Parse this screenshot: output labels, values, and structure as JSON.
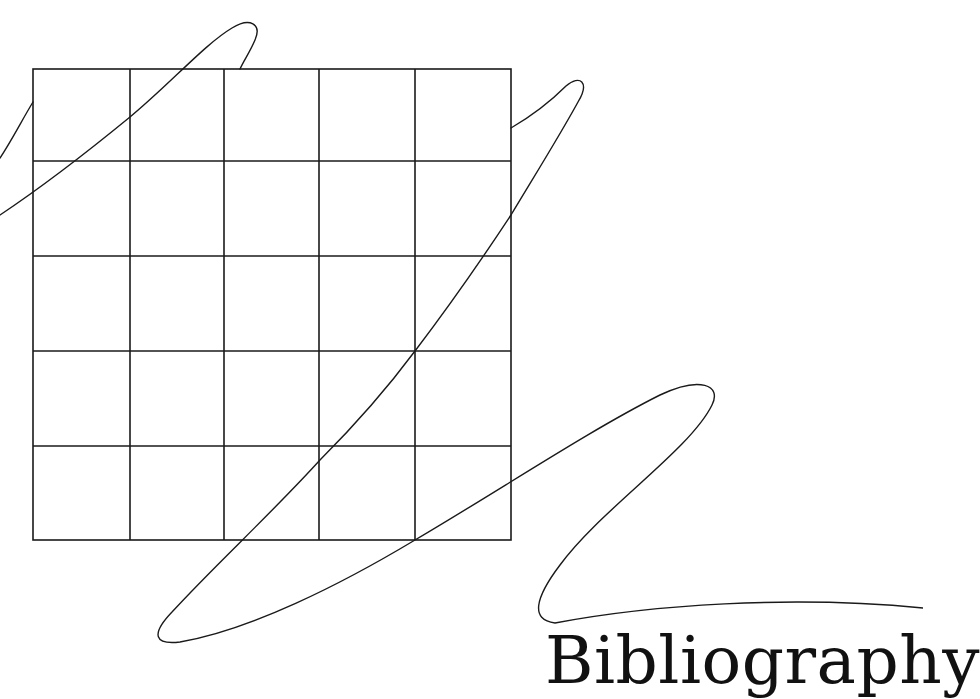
{
  "page": {
    "section_title": "Bibliography",
    "colors": {
      "ink": "#1a1a1a",
      "background": "#ffffff"
    }
  },
  "illustration": {
    "type": "decorative-grid-with-scribble",
    "grid": {
      "rows": 5,
      "columns": 5,
      "x_lines": [
        33,
        130,
        224,
        319,
        415,
        511
      ],
      "y_lines": [
        69,
        161,
        256,
        351,
        446,
        540
      ]
    },
    "scribble_description": "single continuous looping freehand line crossing the grid"
  }
}
